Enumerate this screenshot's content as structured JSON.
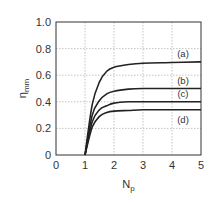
{
  "chart_data": {
    "type": "line",
    "title": "",
    "xlabel": "N_p",
    "ylabel": "η_mm",
    "xlim": [
      0,
      5
    ],
    "ylim": [
      0,
      1.0
    ],
    "grid": true,
    "x_ticks": [
      "0",
      "1",
      "2",
      "3",
      "4",
      "5"
    ],
    "y_ticks": [
      "0",
      "0.2",
      "0.4",
      "0.6",
      "0.8",
      "1.0"
    ],
    "x": [
      1,
      1.25,
      1.5,
      1.75,
      2,
      2.5,
      3,
      4,
      5
    ],
    "series": [
      {
        "name": "(a)",
        "values": [
          0,
          0.38,
          0.55,
          0.63,
          0.66,
          0.68,
          0.69,
          0.695,
          0.7
        ]
      },
      {
        "name": "(b)",
        "values": [
          0,
          0.3,
          0.41,
          0.46,
          0.48,
          0.495,
          0.5,
          0.5,
          0.5
        ]
      },
      {
        "name": "(c)",
        "values": [
          0,
          0.25,
          0.34,
          0.37,
          0.39,
          0.4,
          0.4,
          0.4,
          0.4
        ]
      },
      {
        "name": "(d)",
        "values": [
          0,
          0.21,
          0.29,
          0.32,
          0.33,
          0.335,
          0.34,
          0.34,
          0.34
        ]
      }
    ],
    "annotations": [
      "(a)",
      "(b)",
      "(c)",
      "(d)"
    ]
  }
}
